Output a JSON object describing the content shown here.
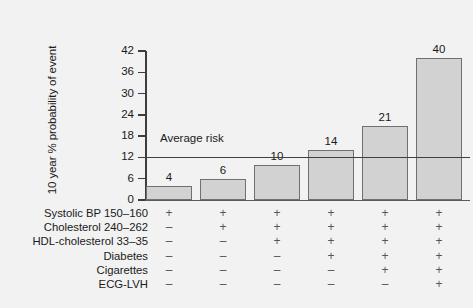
{
  "chart_data": {
    "type": "bar",
    "title": "",
    "xlabel": "",
    "ylabel": "10 year % probability of event",
    "categories": [
      "1",
      "2",
      "3",
      "4",
      "5",
      "6"
    ],
    "values": [
      4,
      6,
      10,
      14,
      21,
      40
    ],
    "value_labels": [
      "4",
      "6",
      "10",
      "14",
      "21",
      "40"
    ],
    "ylim": [
      0,
      42
    ],
    "yticks": [
      0,
      6,
      12,
      18,
      24,
      30,
      36,
      42
    ],
    "ytick_labels": [
      "0",
      "6",
      "12",
      "18",
      "24",
      "30",
      "36",
      "42"
    ],
    "grid": false,
    "legend": "none",
    "bar_fill_color": "#d2d2d2",
    "bar_edge_color": "#707070",
    "annotations": [
      {
        "name": "average-risk-line",
        "label": "Average risk",
        "value": 12,
        "color": "#404040"
      }
    ],
    "risk_factor_table": {
      "rows": [
        {
          "label": "Systolic BP 150–160",
          "marks": [
            "+",
            "+",
            "+",
            "+",
            "+",
            "+"
          ]
        },
        {
          "label": "Cholesterol 240–262",
          "marks": [
            "–",
            "+",
            "+",
            "+",
            "+",
            "+"
          ]
        },
        {
          "label": "HDL-cholesterol 33–35",
          "marks": [
            "–",
            "–",
            "+",
            "+",
            "+",
            "+"
          ]
        },
        {
          "label": "Diabetes",
          "marks": [
            "–",
            "–",
            "–",
            "+",
            "+",
            "+"
          ]
        },
        {
          "label": "Cigarettes",
          "marks": [
            "–",
            "–",
            "–",
            "–",
            "+",
            "+"
          ]
        },
        {
          "label": "ECG-LVH",
          "marks": [
            "–",
            "–",
            "–",
            "–",
            "–",
            "+"
          ]
        }
      ]
    }
  }
}
